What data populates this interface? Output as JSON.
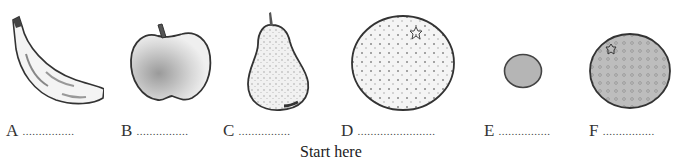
{
  "worksheet": {
    "items": [
      {
        "letter": "A",
        "fruit": "banana",
        "blank": "................"
      },
      {
        "letter": "B",
        "fruit": "apple",
        "blank": "................"
      },
      {
        "letter": "C",
        "fruit": "pear",
        "blank": "................"
      },
      {
        "letter": "D",
        "fruit": "large orange",
        "blank": "........................"
      },
      {
        "letter": "E",
        "fruit": "small round fruit",
        "blank": "................"
      },
      {
        "letter": "F",
        "fruit": "orange",
        "blank": "................"
      }
    ],
    "start_label": "Start here"
  }
}
